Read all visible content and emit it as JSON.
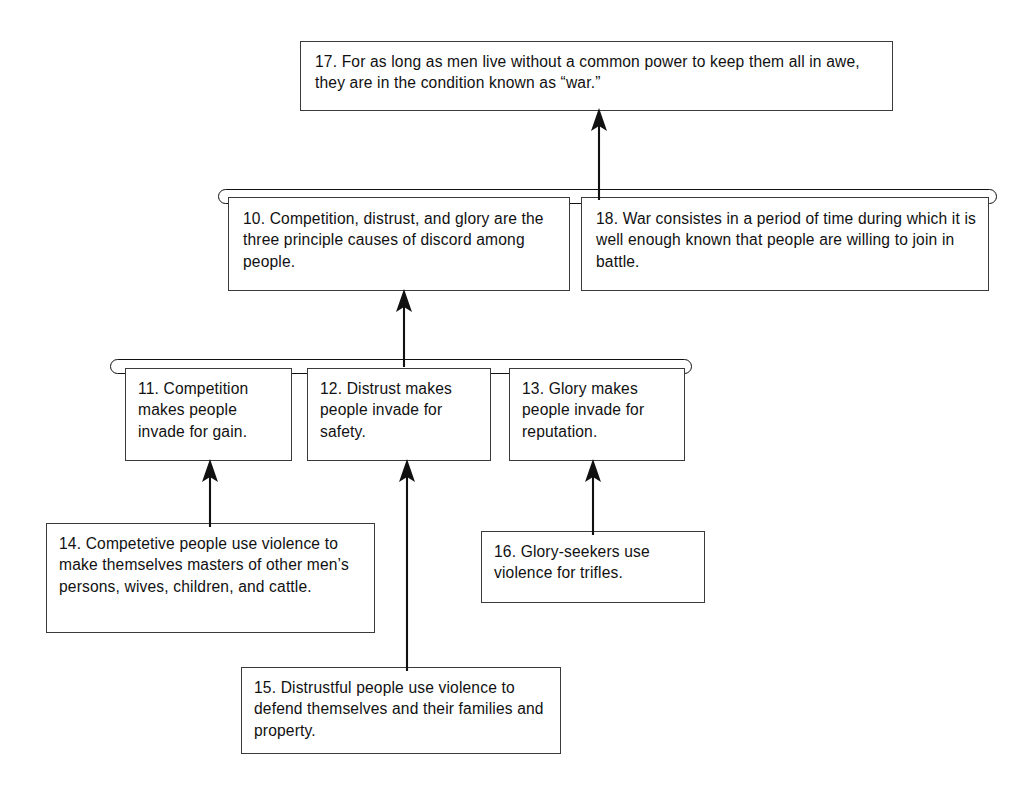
{
  "diagram": {
    "type": "argument-tree",
    "background_color": "#ffffff",
    "line_color": "#111111",
    "box_border_color": "#3a3a3a",
    "nodes": [
      {
        "id": "17",
        "number": "17.",
        "text": "17. For as long as men live without a common power to keep them all in awe, they are in the condition known as “war.”",
        "role": "main-conclusion",
        "tier": 1
      },
      {
        "id": "10",
        "number": "10.",
        "text": "10. Competition, distrust, and glory are the three principle causes of discord among people.",
        "role": "linked-premise",
        "tier": 2
      },
      {
        "id": "18",
        "number": "18.",
        "text": "18. War consistes in a period of time during which it is well enough known that people are willing to join in battle.",
        "role": "linked-premise",
        "tier": 2
      },
      {
        "id": "11",
        "number": "11.",
        "text": "11. Competition makes people invade for gain.",
        "role": "linked-premise",
        "tier": 3
      },
      {
        "id": "12",
        "number": "12.",
        "text": "12. Distrust makes people invade for safety.",
        "role": "linked-premise",
        "tier": 3
      },
      {
        "id": "13",
        "number": "13.",
        "text": "13. Glory makes people invade for reputation.",
        "role": "linked-premise",
        "tier": 3
      },
      {
        "id": "14",
        "number": "14.",
        "text": "14. Competetive people use violence to make themselves masters of other men’s persons, wives, children, and cattle.",
        "role": "supporting-premise",
        "tier": 4
      },
      {
        "id": "16",
        "number": "16.",
        "text": "16. Glory-seekers use violence for trifles.",
        "role": "supporting-premise",
        "tier": 4
      },
      {
        "id": "15",
        "number": "15.",
        "text": "15. Distrustful people use violence to defend themselves and their families and property.",
        "role": "supporting-premise",
        "tier": 5
      }
    ],
    "link_bars": [
      {
        "id": "bar-tier2",
        "joins": [
          "10",
          "18"
        ],
        "supports": "17",
        "shape": "rounded-capsule"
      },
      {
        "id": "bar-tier3",
        "joins": [
          "11",
          "12",
          "13"
        ],
        "supports": "10",
        "shape": "rounded-capsule"
      }
    ],
    "arrows": [
      {
        "id": "arrow-bar2-to-17",
        "from": "bar-tier2",
        "to": "17"
      },
      {
        "id": "arrow-bar3-to-10",
        "from": "bar-tier3",
        "to": "10"
      },
      {
        "id": "arrow-14-to-11",
        "from": "14",
        "to": "11"
      },
      {
        "id": "arrow-15-to-12",
        "from": "15",
        "to": "12"
      },
      {
        "id": "arrow-16-to-13",
        "from": "16",
        "to": "13"
      }
    ]
  }
}
